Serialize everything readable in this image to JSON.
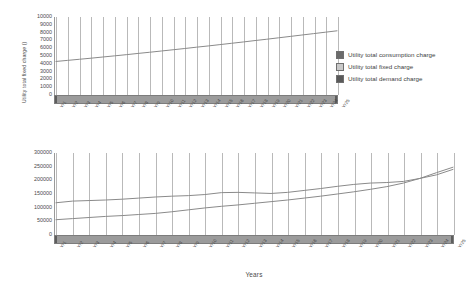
{
  "chart_data": [
    {
      "id": "top",
      "type": "line",
      "title": "",
      "xlabel": "",
      "ylabel": "Utility total fixed charge ()",
      "ylim": [
        0,
        10000
      ],
      "yticks": [
        0,
        1000,
        2000,
        3000,
        4000,
        5000,
        6000,
        7000,
        8000,
        9000,
        10000
      ],
      "ytick_labels": [
        "0",
        "1000",
        "2000",
        "3000",
        "4000",
        "5000",
        "6000",
        "7000",
        "8000",
        "9000",
        "10000"
      ],
      "grid": true,
      "categories": [
        "Yr1",
        "Yr2",
        "Yr3",
        "Yr4",
        "Yr5",
        "Yr6",
        "Yr7",
        "Yr8",
        "Yr9",
        "Yr10",
        "Yr11",
        "Yr12",
        "Yr13",
        "Yr14",
        "Yr15",
        "Yr16",
        "Yr17",
        "Yr18",
        "Yr19",
        "Yr20",
        "Yr21",
        "Yr22",
        "Yr23",
        "Yr24",
        "Yr25"
      ],
      "series": [
        {
          "name": "Utility total fixed charge",
          "color": "#8a8a8a",
          "values": [
            4300,
            4440,
            4580,
            4720,
            4870,
            5020,
            5170,
            5330,
            5480,
            5640,
            5800,
            5960,
            6130,
            6290,
            6460,
            6630,
            6800,
            6980,
            7150,
            7330,
            7510,
            7690,
            7870,
            8050,
            8230
          ]
        }
      ]
    },
    {
      "id": "bottom",
      "type": "line",
      "title": "",
      "xlabel": "Years",
      "ylabel": "",
      "ylim": [
        0,
        300000
      ],
      "yticks": [
        0,
        50000,
        100000,
        150000,
        200000,
        250000,
        300000
      ],
      "ytick_labels": [
        "0",
        "50000",
        "100000",
        "150000",
        "200000",
        "250000",
        "300000"
      ],
      "grid": true,
      "categories": [
        "Yr1",
        "Yr2",
        "Yr3",
        "Yr4",
        "Yr5",
        "Yr6",
        "Yr7",
        "Yr8",
        "Yr9",
        "Yr10",
        "Yr11",
        "Yr12",
        "Yr13",
        "Yr14",
        "Yr15",
        "Yr16",
        "Yr17",
        "Yr18",
        "Yr19",
        "Yr20",
        "Yr21",
        "Yr22",
        "Yr23",
        "Yr24",
        "Yr25"
      ],
      "series": [
        {
          "name": "Utility total consumption charge",
          "color": "#8a8a8a",
          "values": [
            118000,
            124000,
            126000,
            128000,
            131000,
            135000,
            139000,
            142000,
            144000,
            148000,
            155000,
            156000,
            154000,
            152000,
            156000,
            163000,
            170000,
            178000,
            185000,
            190000,
            192000,
            196000,
            207000,
            220000,
            240000
          ]
        },
        {
          "name": "Utility total demand charge",
          "color": "#8a8a8a",
          "values": [
            56000,
            60000,
            64000,
            68000,
            71000,
            75000,
            79000,
            85000,
            92000,
            99000,
            105000,
            110000,
            116000,
            122000,
            128000,
            135000,
            142000,
            150000,
            158000,
            167000,
            177000,
            190000,
            207000,
            228000,
            248000
          ]
        }
      ]
    }
  ],
  "legend": {
    "position": "center-right",
    "items": [
      {
        "label": "Utility total consumption charge",
        "color": "#6b6b6b"
      },
      {
        "label": "Utility total fixed charge",
        "color": "#c9c9c9"
      },
      {
        "label": "Utility total demand charge",
        "color": "#5a5a5a"
      }
    ]
  },
  "axis_title": {
    "x": "Years"
  }
}
